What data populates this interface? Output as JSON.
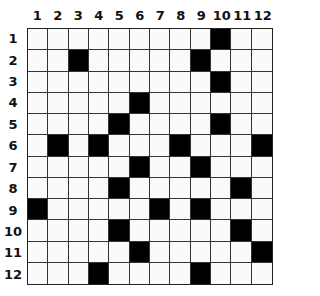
{
  "puzzle": {
    "type": "crossword-grid",
    "rows": 12,
    "cols": 12,
    "column_labels": [
      "1",
      "2",
      "3",
      "4",
      "5",
      "6",
      "7",
      "8",
      "9",
      "10",
      "11",
      "12"
    ],
    "row_labels": [
      "1",
      "2",
      "3",
      "4",
      "5",
      "6",
      "7",
      "8",
      "9",
      "10",
      "11",
      "12"
    ],
    "black_cells": [
      [
        1,
        10
      ],
      [
        2,
        3
      ],
      [
        2,
        9
      ],
      [
        3,
        10
      ],
      [
        4,
        6
      ],
      [
        5,
        5
      ],
      [
        5,
        10
      ],
      [
        6,
        2
      ],
      [
        6,
        4
      ],
      [
        6,
        8
      ],
      [
        6,
        12
      ],
      [
        7,
        6
      ],
      [
        7,
        9
      ],
      [
        8,
        5
      ],
      [
        8,
        11
      ],
      [
        9,
        1
      ],
      [
        9,
        7
      ],
      [
        9,
        9
      ],
      [
        10,
        5
      ],
      [
        10,
        11
      ],
      [
        11,
        6
      ],
      [
        11,
        12
      ],
      [
        12,
        4
      ],
      [
        12,
        9
      ]
    ],
    "colors": {
      "black": "#000000",
      "white": "#fafafa",
      "line": "#333333"
    }
  }
}
